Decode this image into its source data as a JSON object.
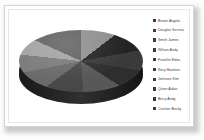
{
  "chart_data": {
    "type": "pie",
    "title": "",
    "three_d": true,
    "legend_position": "right",
    "categories": [
      "Brown Angela",
      "Douglas Serena",
      "Smith James",
      "Wilson Andy",
      "Franklin Edna",
      "Rory Hawkins",
      "Johnson Kim",
      "Quinn Aidan",
      "Berry Andy",
      "Crocker Becky"
    ],
    "values": [
      9.2,
      10.3,
      10.6,
      9.4,
      10.0,
      10.0,
      9.4,
      9.4,
      8.3,
      13.4
    ],
    "slice_angles_deg": [
      33,
      37,
      38,
      34,
      36,
      36,
      34,
      34,
      30,
      48
    ],
    "colors": [
      "#8f8f8f",
      "#242424",
      "#3a3a3a",
      "#2e2e2e",
      "#585858",
      "#484848",
      "#6a6a6a",
      "#7b7b7b",
      "#a3a3a3",
      "#636363"
    ],
    "legend_swatch_color": "#3a3a3a",
    "side_wall_color": "#1b1b1b",
    "background": "#ffffff"
  },
  "legend": {
    "items": [
      {
        "label": "Brown Angela"
      },
      {
        "label": "Douglas Serena"
      },
      {
        "label": "Smith James"
      },
      {
        "label": "Wilson Andy"
      },
      {
        "label": "Franklin Edna"
      },
      {
        "label": "Rory Hawkins"
      },
      {
        "label": "Johnson Kim"
      },
      {
        "label": "Quinn Aidan"
      },
      {
        "label": "Berry Andy"
      },
      {
        "label": "Crocker Becky"
      }
    ]
  }
}
